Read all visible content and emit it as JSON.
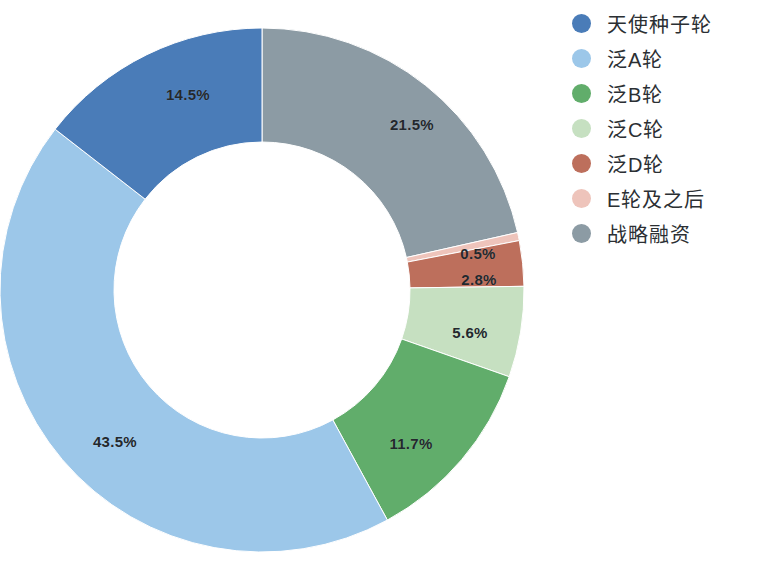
{
  "chart_data": {
    "type": "pie",
    "variant": "donut",
    "title": "",
    "subtitle": "",
    "xlabel": "",
    "ylabel": "",
    "grid": false,
    "legend_position": "right",
    "start_angle_deg": 0,
    "direction": "clockwise",
    "value_unit": "%",
    "total": 100.1,
    "categories": [
      "天使种子轮",
      "泛A轮",
      "泛B轮",
      "泛C轮",
      "泛D轮",
      "E轮及之后",
      "战略融资"
    ],
    "values": [
      14.5,
      43.5,
      11.7,
      5.6,
      2.8,
      0.5,
      21.5
    ],
    "colors": [
      "#4a7cb8",
      "#9cc7e9",
      "#61ad6b",
      "#c6e0c1",
      "#bd6f5c",
      "#eec4bb",
      "#8c9ba4"
    ],
    "draw_order": [
      "战略融资",
      "E轮及之后",
      "泛D轮",
      "泛C轮",
      "泛B轮",
      "泛A轮",
      "天使种子轮"
    ],
    "slices": [
      {
        "name": "战略融资",
        "value": 21.5,
        "label": "21.5%",
        "color": "#8c9ba4",
        "label_x": 412,
        "label_y": 124
      },
      {
        "name": "E轮及之后",
        "value": 0.5,
        "label": "0.5%",
        "color": "#eec4bb",
        "label_x": 478,
        "label_y": 253
      },
      {
        "name": "泛D轮",
        "value": 2.8,
        "label": "2.8%",
        "color": "#bd6f5c",
        "label_x": 479,
        "label_y": 279
      },
      {
        "name": "泛C轮",
        "value": 5.6,
        "label": "5.6%",
        "color": "#c6e0c1",
        "label_x": 470,
        "label_y": 332
      },
      {
        "name": "泛B轮",
        "value": 11.7,
        "label": "11.7%",
        "color": "#61ad6b",
        "label_x": 411,
        "label_y": 443
      },
      {
        "name": "泛A轮",
        "value": 43.5,
        "label": "43.5%",
        "color": "#9cc7e9",
        "label_x": 115,
        "label_y": 441
      },
      {
        "name": "天使种子轮",
        "value": 14.5,
        "label": "14.5%",
        "color": "#4a7cb8",
        "label_x": 188,
        "label_y": 94
      }
    ]
  },
  "legend": {
    "items": [
      {
        "label": "天使种子轮",
        "color": "#4a7cb8"
      },
      {
        "label": "泛A轮",
        "color": "#9cc7e9"
      },
      {
        "label": "泛B轮",
        "color": "#61ad6b"
      },
      {
        "label": "泛C轮",
        "color": "#c6e0c1"
      },
      {
        "label": "泛D轮",
        "color": "#bd6f5c"
      },
      {
        "label": "E轮及之后",
        "color": "#eec4bb"
      },
      {
        "label": "战略融资",
        "color": "#8c9ba4"
      }
    ]
  }
}
